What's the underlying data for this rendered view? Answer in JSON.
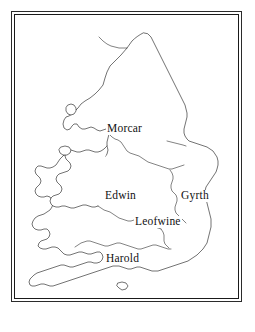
{
  "figure": {
    "background_color": "#ffffff",
    "frame_color": "#1a1a1a",
    "coast_stroke_color": "#1c1c1c",
    "label_color": "#111111"
  },
  "map": {
    "region_labels": [
      {
        "name": "Morcar",
        "text": "Morcar",
        "x": 106,
        "y": 115
      },
      {
        "name": "Edwin",
        "text": "Edwin",
        "x": 104,
        "y": 182
      },
      {
        "name": "Gyrth",
        "text": "Gyrth",
        "x": 180,
        "y": 182
      },
      {
        "name": "Leofwine",
        "text": "Leofwine",
        "x": 140,
        "y": 208
      },
      {
        "name": "Harold",
        "text": "Harold",
        "x": 105,
        "y": 245
      }
    ],
    "islands": [
      {
        "name": "anglesey"
      },
      {
        "name": "isle-of-man"
      },
      {
        "name": "isle-of-wight"
      }
    ]
  },
  "caption": {
    "text": ""
  }
}
